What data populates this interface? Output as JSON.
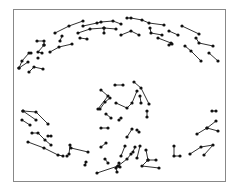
{
  "diagram": {
    "frame": {
      "x": 13,
      "y": 9,
      "w": 212,
      "h": 172,
      "stroke": "#888888"
    },
    "edge_color": "#1a1a1a",
    "node_color": "#111111",
    "node_radius": 1.6,
    "polylines": [
      [
        [
          55,
          33
        ],
        [
          69,
          26
        ],
        [
          83,
          21
        ]
      ],
      [
        [
          83,
          26
        ],
        [
          97,
          23
        ],
        [
          101,
          22
        ],
        [
          113,
          21
        ],
        [
          121,
          24
        ]
      ],
      [
        [
          78,
          33
        ],
        [
          90,
          29
        ],
        [
          104,
          28
        ],
        [
          116,
          29
        ]
      ],
      [
        [
          104,
          28
        ],
        [
          104,
          33
        ]
      ],
      [
        [
          80,
          38
        ],
        [
          87,
          39
        ]
      ],
      [
        [
          62,
          36
        ],
        [
          60,
          41
        ]
      ],
      [
        [
          37,
          41
        ],
        [
          44,
          41
        ],
        [
          44,
          45
        ]
      ],
      [
        [
          44,
          45
        ],
        [
          38,
          52
        ],
        [
          42,
          53
        ]
      ],
      [
        [
          38,
          58
        ]
      ],
      [
        [
          50,
          52
        ],
        [
          59,
          47
        ],
        [
          72,
          44
        ]
      ],
      [
        [
          31,
          53
        ],
        [
          29,
          53
        ],
        [
          22,
          61
        ],
        [
          19,
          68
        ]
      ],
      [
        [
          19,
          68
        ],
        [
          28,
          62
        ]
      ],
      [
        [
          29,
          72
        ],
        [
          34,
          67
        ],
        [
          43,
          69
        ]
      ],
      [
        [
          127,
          18
        ],
        [
          131,
          18
        ],
        [
          142,
          20
        ],
        [
          149,
          23
        ],
        [
          164,
          25
        ]
      ],
      [
        [
          121,
          35
        ],
        [
          131,
          31
        ],
        [
          139,
          35
        ]
      ],
      [
        [
          150,
          28
        ],
        [
          151,
          33
        ],
        [
          162,
          35
        ]
      ],
      [
        [
          169,
          31
        ],
        [
          178,
          35
        ]
      ],
      [
        [
          158,
          38
        ],
        [
          171,
          43
        ]
      ],
      [
        [
          169,
          45
        ],
        [
          172,
          44
        ]
      ],
      [
        [
          182,
          26
        ],
        [
          199,
          34
        ]
      ],
      [
        [
          196,
          38
        ],
        [
          199,
          43
        ],
        [
          213,
          46
        ]
      ],
      [
        [
          185,
          46
        ],
        [
          191,
          51
        ],
        [
          201,
          61
        ]
      ],
      [
        [
          209,
          53
        ],
        [
          218,
          61
        ]
      ],
      [
        [
          23,
          111
        ],
        [
          36,
          112
        ],
        [
          48,
          124
        ]
      ],
      [
        [
          23,
          111
        ],
        [
          36,
          120
        ]
      ],
      [
        [
          22,
          120
        ],
        [
          30,
          125
        ]
      ],
      [
        [
          32,
          133
        ],
        [
          38,
          133
        ],
        [
          45,
          140
        ],
        [
          51,
          145
        ]
      ],
      [
        [
          48,
          136
        ],
        [
          51,
          136
        ]
      ],
      [
        [
          28,
          142
        ],
        [
          44,
          148
        ],
        [
          58,
          155
        ],
        [
          63,
          156
        ]
      ],
      [
        [
          67,
          156
        ],
        [
          69,
          154
        ],
        [
          70,
          145
        ],
        [
          71,
          148
        ],
        [
          88,
          152
        ]
      ],
      [
        [
          86,
          162
        ],
        [
          85,
          165
        ]
      ],
      [
        [
          100,
          109
        ],
        [
          105,
          102
        ],
        [
          110,
          98
        ]
      ],
      [
        [
          106,
          114
        ],
        [
          111,
          118
        ]
      ],
      [
        [
          101,
          128
        ],
        [
          108,
          128
        ]
      ],
      [
        [
          106,
          143
        ],
        [
          101,
          147
        ]
      ],
      [
        [
          105,
          159
        ],
        [
          108,
          163
        ]
      ],
      [
        [
          97,
          173
        ],
        [
          118,
          166
        ],
        [
          120,
          167
        ],
        [
          119,
          163
        ]
      ],
      [
        [
          101,
          90
        ],
        [
          108,
          96
        ],
        [
          98,
          109
        ]
      ],
      [
        [
          115,
          85
        ],
        [
          123,
          85
        ]
      ],
      [
        [
          134,
          82
        ],
        [
          141,
          88
        ],
        [
          149,
          104
        ]
      ],
      [
        [
          116,
          103
        ],
        [
          127,
          108
        ],
        [
          132,
          103
        ],
        [
          137,
          91
        ]
      ],
      [
        [
          121,
          118
        ],
        [
          119,
          120
        ]
      ],
      [
        [
          127,
          137
        ],
        [
          132,
          129
        ]
      ],
      [
        [
          125,
          146
        ],
        [
          121,
          156
        ]
      ],
      [
        [
          135,
          147
        ],
        [
          133,
          152
        ]
      ],
      [
        [
          137,
          130
        ],
        [
          139,
          132
        ]
      ],
      [
        [
          140,
          96
        ],
        [
          141,
          103
        ]
      ],
      [
        [
          147,
          111
        ],
        [
          147,
          117
        ]
      ],
      [
        [
          140,
          146
        ],
        [
          137,
          158
        ]
      ],
      [
        [
          118,
          166
        ],
        [
          127,
          159
        ],
        [
          131,
          154
        ]
      ],
      [
        [
          146,
          150
        ],
        [
          148,
          160
        ],
        [
          156,
          160
        ]
      ],
      [
        [
          148,
          160
        ],
        [
          142,
          166
        ],
        [
          159,
          168
        ]
      ],
      [
        [
          117,
          172
        ],
        [
          116,
          168
        ]
      ],
      [
        [
          174,
          146
        ],
        [
          174,
          156
        ],
        [
          180,
          156
        ]
      ],
      [
        [
          190,
          154
        ],
        [
          201,
          147
        ],
        [
          213,
          145
        ],
        [
          204,
          155
        ]
      ],
      [
        [
          197,
          134
        ],
        [
          207,
          128
        ],
        [
          218,
          131
        ]
      ],
      [
        [
          207,
          128
        ],
        [
          216,
          121
        ]
      ],
      [
        [
          212,
          111
        ],
        [
          216,
          111
        ]
      ]
    ]
  }
}
